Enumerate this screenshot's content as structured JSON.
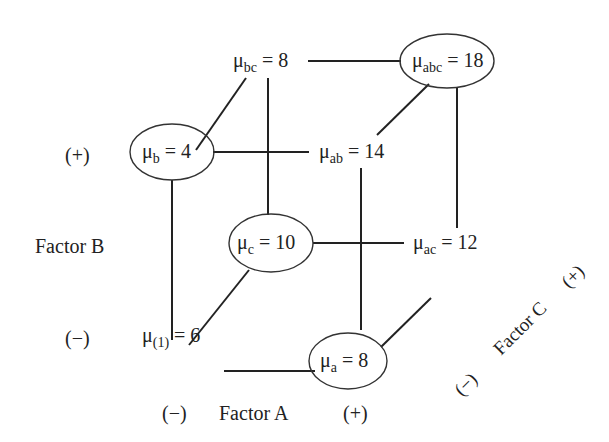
{
  "diagram": {
    "type": "2^3 factorial design cube",
    "nodes": [
      {
        "id": "abc",
        "symbol": "μ",
        "subscript": "abc",
        "value": "18",
        "circled": true
      },
      {
        "id": "bc",
        "symbol": "μ",
        "subscript": "bc",
        "value": "8",
        "circled": false
      },
      {
        "id": "b",
        "symbol": "μ",
        "subscript": "b",
        "value": "4",
        "circled": true
      },
      {
        "id": "ab",
        "symbol": "μ",
        "subscript": "ab",
        "value": "14",
        "circled": false
      },
      {
        "id": "c",
        "symbol": "μ",
        "subscript": "c",
        "value": "10",
        "circled": true
      },
      {
        "id": "ac",
        "symbol": "μ",
        "subscript": "ac",
        "value": "12",
        "circled": false
      },
      {
        "id": "one",
        "symbol": "μ",
        "subscript": "(1)",
        "value": "6",
        "circled": false
      },
      {
        "id": "a",
        "symbol": "μ",
        "subscript": "a",
        "value": "8",
        "circled": true
      }
    ],
    "axes": {
      "factor_a": {
        "label": "Factor A",
        "minus": "(−)",
        "plus": "(+)"
      },
      "factor_b": {
        "label": "Factor B",
        "minus": "(−)",
        "plus": "(+)"
      },
      "factor_c": {
        "label": "Factor C",
        "minus": "(−)",
        "plus": "(+)"
      }
    },
    "equals": "="
  }
}
